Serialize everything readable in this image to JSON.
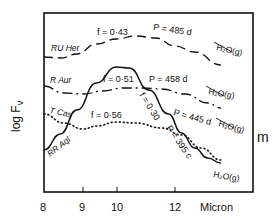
{
  "chart_data": {
    "type": "line",
    "title": "",
    "xlabel": "Micron",
    "ylabel": "log Fν",
    "right_label": "m",
    "x_ticks": [
      8,
      9,
      10,
      12
    ],
    "xlim": [
      8,
      13.4
    ],
    "grid": false,
    "series": [
      {
        "name": "RU Her",
        "style": "dashed",
        "annotations": [
          "f = 0.43",
          "P = 485 d",
          "H2O(g)"
        ],
        "points": [
          [
            8.0,
            57
          ],
          [
            8.5,
            58
          ],
          [
            9.0,
            54
          ],
          [
            9.6,
            44
          ],
          [
            10.2,
            39
          ],
          [
            10.8,
            36
          ],
          [
            11.4,
            38
          ],
          [
            12.0,
            46
          ],
          [
            12.6,
            52
          ],
          [
            13.4,
            65
          ]
        ]
      },
      {
        "name": "R Aur",
        "style": "dash-dot",
        "annotations": [
          "f = 0.51",
          "P = 458 d",
          "H2O(g)"
        ],
        "points": [
          [
            8.0,
            86
          ],
          [
            8.6,
            93
          ],
          [
            9.2,
            94
          ],
          [
            9.8,
            91
          ],
          [
            10.4,
            88
          ],
          [
            11.0,
            88
          ],
          [
            11.6,
            89
          ],
          [
            12.3,
            94
          ],
          [
            13.0,
            103
          ],
          [
            13.4,
            108
          ]
        ]
      },
      {
        "name": "T Cas",
        "style": "dotted",
        "annotations": [
          "f = 0.56",
          "P = 445 d",
          "H2O(g)"
        ],
        "points": [
          [
            8.0,
            114
          ],
          [
            8.6,
            123
          ],
          [
            9.2,
            129
          ],
          [
            9.6,
            126
          ],
          [
            10.2,
            122
          ],
          [
            10.8,
            123
          ],
          [
            11.6,
            128
          ],
          [
            12.2,
            135
          ],
          [
            12.8,
            148
          ],
          [
            13.4,
            160
          ]
        ]
      },
      {
        "name": "RR Aql",
        "style": "solid",
        "annotations": [
          "f = 0.30",
          "P = 395 c",
          "H2O(g)"
        ],
        "points": [
          [
            8.0,
            150
          ],
          [
            8.5,
            134
          ],
          [
            9.0,
            110
          ],
          [
            9.6,
            83
          ],
          [
            10.2,
            67
          ],
          [
            10.6,
            68
          ],
          [
            11.2,
            90
          ],
          [
            11.8,
            114
          ],
          [
            12.2,
            133
          ],
          [
            12.6,
            148
          ],
          [
            13.0,
            158
          ],
          [
            13.4,
            163
          ]
        ]
      }
    ]
  },
  "labels": {
    "y_axis": "log F",
    "y_axis_sub": "ν",
    "x_axis": "Micron",
    "right": "m",
    "ticks": [
      "8",
      "9",
      "10",
      "12"
    ],
    "ru_her": "RU Her",
    "r_aur": "R Aur",
    "t_cas": "T Cas",
    "rr_aql": "RR Aql",
    "f_ru_her": "f = 0·43",
    "f_r_aur": "f = 0·51",
    "f_t_cas": "f = 0·56",
    "f_rr_aql": "f = 0·30",
    "p_ru_her": "P = 485 d",
    "p_r_aur": "P = 458 d",
    "p_t_cas": "P = 445 d",
    "p_rr_aql": "P = 395 c",
    "h2o_1": "H₂O(g)",
    "h2o_2": "H₂O(g)",
    "h2o_3": "H₂O(g)",
    "h2o_4": "H₂O(g)"
  }
}
